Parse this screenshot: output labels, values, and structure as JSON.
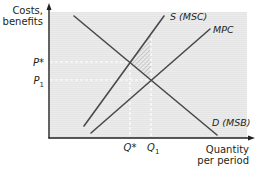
{
  "diagram": {
    "type": "supply-demand-externality",
    "y_axis_label_line1": "Costs,",
    "y_axis_label_line2": "benefits",
    "x_axis_label_line1": "Quantity",
    "x_axis_label_line2": "per period",
    "price_labels": {
      "p_star": "P*",
      "p1_letter": "P",
      "p1_sub": "1"
    },
    "quantity_labels": {
      "q_star": "Q*",
      "q1_letter": "Q",
      "q1_sub": "1"
    },
    "curves": [
      {
        "id": "msc",
        "label": "S (MSC)",
        "x1": 84,
        "y1": 126,
        "x2": 164,
        "y2": 16
      },
      {
        "id": "mpc",
        "label": "MPC",
        "x1": 91,
        "y1": 133,
        "x2": 210,
        "y2": 29
      },
      {
        "id": "msb",
        "label": "D (MSB)",
        "x1": 74,
        "y1": 16,
        "x2": 217,
        "y2": 135
      }
    ],
    "colors": {
      "plot_background": "#ececec",
      "curve": "#4a4a4a",
      "axis": "#231f20",
      "dashed_guide": "#ffffff",
      "shaded_area": "#bdbdbd"
    },
    "annotation": "Shaded triangle: deadweight loss between MSC and MSB from Q* to Q1"
  }
}
